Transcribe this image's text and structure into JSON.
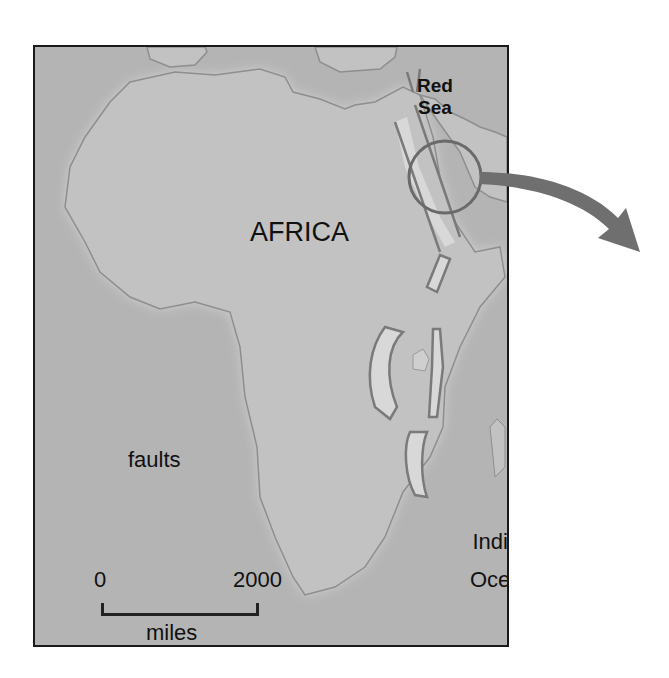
{
  "map": {
    "labels": {
      "continent": "AFRICA",
      "sea_line1": "Red",
      "sea_line2": "Sea",
      "faults": "faults",
      "ocean_line1": "Indian",
      "ocean_line2": "Ocean"
    },
    "scale_bar": {
      "start": "0",
      "end": "2000",
      "unit": "miles"
    },
    "colors": {
      "ocean": "#b4b4b4",
      "land": "#c2c2c2",
      "coastline": "#8e8e8e",
      "fault_fill": "#d8d8d8",
      "fault_line": "#7a7a7a",
      "highlight_circle": "#6a6a6a",
      "arrow": "#6f6f6f",
      "frame": "#1a1a1a"
    }
  }
}
